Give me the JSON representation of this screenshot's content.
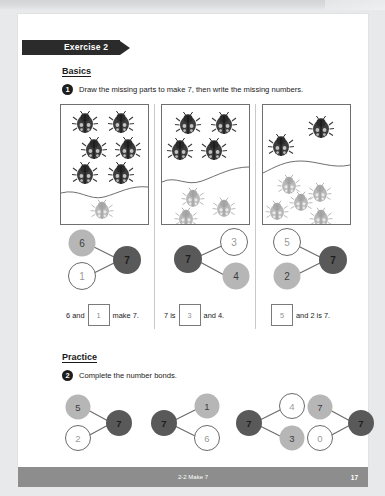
{
  "document": {
    "exercise_banner": "Exercise 2",
    "footer_title": "2-2  Make 7",
    "page_number": "17"
  },
  "basics": {
    "heading": "Basics",
    "question_number": "1",
    "instruction": "Draw the missing parts to make 7, then write the missing numbers.",
    "bug_boxes": [
      {
        "dark_count": 6,
        "light_count": 1
      },
      {
        "dark_count": 4,
        "light_count": 3
      },
      {
        "dark_count": 2,
        "light_count": 5
      }
    ],
    "bonds": [
      {
        "layout": "left-whole-right",
        "whole": {
          "value": "7",
          "style": "dark"
        },
        "top_part": {
          "value": "6",
          "style": "light"
        },
        "bottom_part": {
          "value": "1",
          "style": "blank"
        }
      },
      {
        "layout": "right-whole-left",
        "whole": {
          "value": "7",
          "style": "dark"
        },
        "top_part": {
          "value": "3",
          "style": "blank"
        },
        "bottom_part": {
          "value": "4",
          "style": "light"
        }
      },
      {
        "layout": "left-whole-right",
        "whole": {
          "value": "7",
          "style": "dark"
        },
        "top_part": {
          "value": "5",
          "style": "blank"
        },
        "bottom_part": {
          "value": "2",
          "style": "light"
        }
      }
    ],
    "sentences": [
      {
        "parts": [
          "6 and",
          "BOX:1",
          "make 7."
        ]
      },
      {
        "parts": [
          "7 is",
          "BOX:3",
          "and 4."
        ]
      },
      {
        "parts": [
          "BOX:5",
          "and 2 is 7."
        ]
      }
    ]
  },
  "practice": {
    "heading": "Practice",
    "question_number": "2",
    "instruction": "Complete the number bonds.",
    "bonds": [
      {
        "layout": "left-whole-right",
        "whole": {
          "value": "7",
          "style": "dark"
        },
        "top_part": {
          "value": "5",
          "style": "light"
        },
        "bottom_part": {
          "value": "2",
          "style": "blank"
        }
      },
      {
        "layout": "right-whole-left",
        "whole": {
          "value": "7",
          "style": "dark"
        },
        "top_part": {
          "value": "1",
          "style": "light"
        },
        "bottom_part": {
          "value": "6",
          "style": "blank"
        }
      },
      {
        "layout": "right-whole-left",
        "whole": {
          "value": "7",
          "style": "dark"
        },
        "top_part": {
          "value": "4",
          "style": "blank"
        },
        "bottom_part": {
          "value": "3",
          "style": "light"
        }
      },
      {
        "layout": "left-whole-right",
        "whole": {
          "value": "7",
          "style": "dark"
        },
        "top_part": {
          "value": "7",
          "style": "light"
        },
        "bottom_part": {
          "value": "0",
          "style": "blank"
        }
      }
    ]
  },
  "colors": {
    "dark_circle": "#595959",
    "light_circle": "#b6b6b6",
    "blank_circle": "#ffffff",
    "banner": "#2b2b2b",
    "footer": "#8d8d8d",
    "dark_bug": "#3c3c3c",
    "light_bug": "#b9b9b9"
  }
}
